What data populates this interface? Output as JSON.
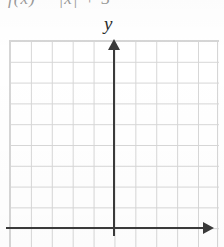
{
  "figure": {
    "type": "blank-coordinate-grid",
    "cropped_formula_text": "f(x) =   |x| + 3",
    "y_axis_label": "y",
    "x_axis_label": "",
    "colors": {
      "grid_line": "#d6d6d6",
      "axis": "#3a3a3a",
      "background": "#ffffff",
      "faded_text": "#9a9a9a",
      "label_text": "#2b2b2b"
    }
  },
  "chart_data": {
    "type": "scatter",
    "title": "",
    "subtitle": "",
    "xlabel": "",
    "ylabel": "y",
    "series": [
      {
        "name": "empty-plot",
        "x": [],
        "y": []
      }
    ],
    "xlim": [
      -5,
      5
    ],
    "ylim": [
      -1,
      9
    ],
    "xticks": [
      -5,
      -4,
      -3,
      -2,
      -1,
      0,
      1,
      2,
      3,
      4,
      5
    ],
    "yticks": [
      -1,
      0,
      1,
      2,
      3,
      4,
      5,
      6,
      7,
      8,
      9
    ],
    "xtick_labels": [],
    "ytick_labels": [],
    "grid": true,
    "grid_columns": 10,
    "grid_rows": 10,
    "legend": "none",
    "annotations": [
      {
        "name": "y-axis-label",
        "text": "y",
        "position": "top-of-vertical-axis"
      }
    ]
  }
}
